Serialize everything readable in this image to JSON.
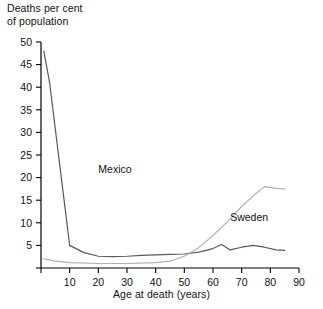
{
  "chart_data": {
    "type": "line",
    "title": "",
    "ylabel": "Deaths per cent\nof population",
    "xlabel": "Age at death (years)",
    "xlim": [
      0,
      90
    ],
    "ylim": [
      0,
      50
    ],
    "xticks": [
      0,
      10,
      20,
      30,
      40,
      50,
      60,
      70,
      80,
      90
    ],
    "xtick_labels": [
      "",
      "10",
      "20",
      "30",
      "40",
      "50",
      "60",
      "70",
      "80",
      "90"
    ],
    "yticks": [
      0,
      5,
      10,
      15,
      20,
      25,
      30,
      35,
      40,
      45,
      50
    ],
    "ytick_labels": [
      "",
      "5",
      "10",
      "15",
      "20",
      "25",
      "30",
      "35",
      "40",
      "45",
      "50"
    ],
    "grid": false,
    "legend": "inline-annotations",
    "series": [
      {
        "name": "Mexico",
        "color": "#595959",
        "label_x": 20,
        "label_y": 21,
        "x": [
          1,
          3,
          10,
          15,
          20,
          25,
          30,
          35,
          40,
          45,
          50,
          55,
          60,
          63,
          66,
          70,
          74,
          78,
          82,
          85
        ],
        "values": [
          48,
          41,
          5.0,
          3.4,
          2.6,
          2.5,
          2.6,
          2.8,
          2.9,
          3.0,
          3.1,
          3.5,
          4.3,
          5.2,
          4.0,
          4.6,
          5.0,
          4.6,
          4.0,
          3.9
        ]
      },
      {
        "name": "Sweden",
        "color": "#b0b0b0",
        "label_x": 66,
        "label_y": 10.5,
        "x": [
          1,
          5,
          10,
          20,
          30,
          40,
          45,
          50,
          55,
          60,
          65,
          70,
          75,
          78,
          82,
          85
        ],
        "values": [
          2.0,
          1.5,
          1.2,
          1.0,
          1.0,
          1.2,
          1.5,
          2.6,
          4.5,
          7.2,
          10.2,
          13.6,
          16.5,
          18.0,
          17.6,
          17.5
        ]
      }
    ]
  }
}
